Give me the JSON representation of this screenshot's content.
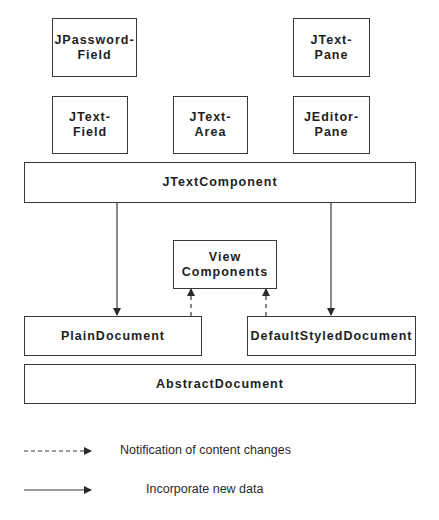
{
  "diagram": {
    "type": "component-architecture",
    "components": {
      "jpasswordfield": {
        "line1": "JPassword-",
        "line2": "Field"
      },
      "jtextpane": {
        "line1": "JText-",
        "line2": "Pane"
      },
      "jtextfield": {
        "line1": "JText-",
        "line2": "Field"
      },
      "jtextarea": {
        "line1": "JText-",
        "line2": "Area"
      },
      "jeditorpane": {
        "line1": "JEditor-",
        "line2": "Pane"
      },
      "jtextcomponent": {
        "label": "JTextComponent"
      },
      "view_components": {
        "line1": "View",
        "line2": "Components"
      },
      "plaindocument": {
        "label": "PlainDocument"
      },
      "defaultstyleddocument": {
        "label": "DefaultStyledDocument"
      },
      "abstractdocument": {
        "label": "AbstractDocument"
      }
    },
    "edges": [
      {
        "from": "JTextComponent",
        "to": "PlainDocument",
        "style": "solid"
      },
      {
        "from": "JTextComponent",
        "to": "DefaultStyledDocument",
        "style": "solid"
      },
      {
        "from": "PlainDocument",
        "to": "View Components",
        "style": "dashed"
      },
      {
        "from": "DefaultStyledDocument",
        "to": "View Components",
        "style": "dashed"
      }
    ],
    "colors": {
      "stroke": "#3a3a3a",
      "text": "#1e1e1e",
      "background": "#ffffff"
    }
  },
  "legend": {
    "dashed": {
      "label": "Notification of content changes"
    },
    "solid": {
      "label": "Incorporate new data"
    }
  }
}
